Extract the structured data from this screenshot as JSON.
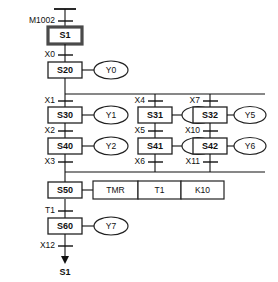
{
  "diagram": {
    "colors": {
      "line": "#111111",
      "init_step_border": "#4a4a4a",
      "background": "#ffffff"
    },
    "initial_step": {
      "name": "S1"
    },
    "return_target": {
      "name": "S1"
    },
    "transitions": {
      "t_init": "M1002",
      "t_s1": "X0",
      "t_b1_a": "X1",
      "t_b1_b": "X2",
      "t_b1_c": "X3",
      "t_b2_a": "X4",
      "t_b2_b": "X5",
      "t_b2_c": "X6",
      "t_b3_a": "X7",
      "t_b3_b": "X10",
      "t_b3_c": "X11",
      "t_s50": "T1",
      "t_s60": "X12"
    },
    "steps": {
      "s20": "S20",
      "s30": "S30",
      "s40": "S40",
      "s31": "S31",
      "s41": "S41",
      "s32": "S32",
      "s42": "S42",
      "s50": "S50",
      "s60": "S60"
    },
    "coils": {
      "y0": "Y0",
      "y1": "Y1",
      "y2": "Y2",
      "y3": "Y3",
      "y4": "Y4",
      "y5": "Y5",
      "y6": "Y6",
      "y7": "Y7"
    },
    "timer_instruction": {
      "mnemonic": "TMR",
      "device": "T1",
      "preset": "K10"
    }
  }
}
